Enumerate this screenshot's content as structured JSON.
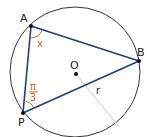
{
  "diagram": {
    "colors": {
      "circle": "#333333",
      "triangle": "#1f3f7a",
      "radius": "#c8c8c8",
      "angle": "#d9602a",
      "point": "#111111"
    },
    "circle": {
      "cx": 75,
      "cy": 72,
      "r": 65
    },
    "points": {
      "A": {
        "label": "A",
        "x": 31,
        "y": 26
      },
      "B": {
        "label": "B",
        "x": 139,
        "y": 61
      },
      "P": {
        "label": "P",
        "x": 23,
        "y": 113
      },
      "O": {
        "label": "O",
        "x": 76,
        "y": 74
      }
    },
    "radius_label": "r",
    "angles": {
      "A": {
        "label": "x"
      },
      "P": {
        "numerator": "π",
        "denominator": "3"
      }
    }
  }
}
